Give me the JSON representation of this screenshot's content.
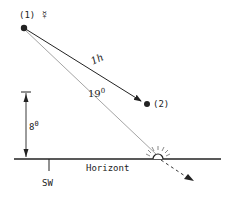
{
  "diagram": {
    "type": "astronomical-sketch",
    "points": {
      "p1": {
        "label": "(1)",
        "symbol": "☿",
        "symbol_name": "mercury-symbol"
      },
      "p2": {
        "label": "(2)"
      }
    },
    "motion_label": "1h",
    "angle_to_sun_label": "19°",
    "angle_to_sun_value": "19",
    "altitude_label": "8°",
    "altitude_value": "8",
    "horizon_label": "Horizont",
    "direction_label": "SW",
    "colors": {
      "ink": "#222222",
      "light_line": "#9a9a9a",
      "background": "#ffffff"
    }
  }
}
